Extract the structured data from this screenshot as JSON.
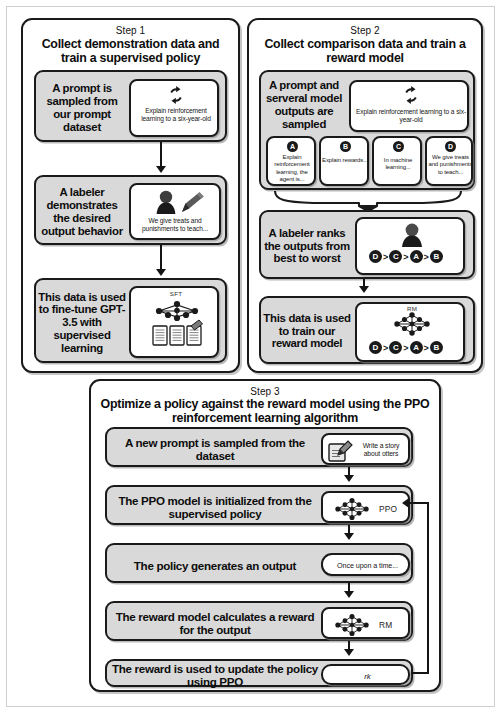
{
  "step1": {
    "step_label": "Step 1",
    "title": "Collect demonstration data and train a supervised policy",
    "blocks": [
      {
        "description": "A prompt is sampled from our prompt dataset",
        "sample_text": "Explain reinforcement learning to a six-year-old",
        "icon": "circular-arrows-icon"
      },
      {
        "description": "A labeler demonstrates the desired output behavior",
        "sample_text": "We give treats and punishments to teach...",
        "icon": "labeler-pencil-icon"
      },
      {
        "description": "This data is used  to fine-tune GPT-3.5 with supervised learning",
        "model_label": "SFT",
        "icon": "neural-network-documents-icon"
      }
    ]
  },
  "step2": {
    "step_label": "Step 2",
    "title": "Collect comparison data and train a reward model",
    "blocks": [
      {
        "description": "A prompt and serveral model outputs are sampled",
        "sample_text": "Explain reinforcement learning to a six-year-old",
        "icon": "circular-arrows-icon"
      },
      {
        "description": "A labeler ranks the outputs from best to worst",
        "icon": "labeler-icon",
        "ranking": [
          "D",
          "C",
          "A",
          "B"
        ],
        "ranking_separator": ">"
      },
      {
        "description": "This data is used to train our reward model",
        "model_label": "RM",
        "icon": "neural-network-icon",
        "ranking": [
          "D",
          "C",
          "A",
          "B"
        ],
        "ranking_separator": ">"
      }
    ],
    "outputs": [
      {
        "letter": "A",
        "text": "Explain reinforcement learning, the agent is..."
      },
      {
        "letter": "B",
        "text": "Explain rewards..."
      },
      {
        "letter": "C",
        "text": "In machine learning..."
      },
      {
        "letter": "D",
        "text": "We give treats and punishments to teach..."
      }
    ]
  },
  "step3": {
    "step_label": "Step 3",
    "title": "Optimize a policy against the reward model using the PPO reinforcement learning algorithm",
    "rows": [
      {
        "description": "A new prompt is sampled from the dataset",
        "side_text": "Write a story about otters",
        "icon": "document-pencil-icon"
      },
      {
        "description": "The PPO model is initialized from the supervised policy",
        "side_text": "PPO",
        "icon": "neural-network-icon"
      },
      {
        "description": "The policy generates an output",
        "side_text": "Once upon a time...",
        "icon": "none"
      },
      {
        "description": "The reward model calculates a reward for the output",
        "side_text": "RM",
        "icon": "neural-network-icon"
      },
      {
        "description": "The reward is used to update the policy using PPO",
        "side_text": "rk",
        "icon": "none"
      }
    ]
  },
  "colors": {
    "stroke": "#1a1a1a",
    "block_fill": "#d9d9d9",
    "card_fill": "#ffffff",
    "page_border": "#cfcfcf"
  }
}
